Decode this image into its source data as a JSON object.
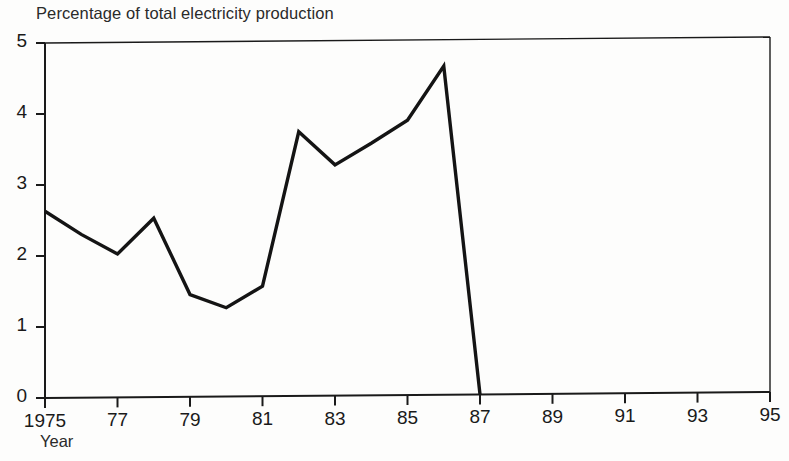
{
  "chart_data": {
    "type": "line",
    "title": "Percentage of total electricity production",
    "xlabel": "Year",
    "ylabel": "",
    "xlim": [
      1975,
      1995
    ],
    "ylim": [
      0,
      5
    ],
    "grid": false,
    "legend": null,
    "xticks": [
      1975,
      1977,
      1979,
      1981,
      1983,
      1985,
      1987,
      1989,
      1991,
      1993,
      1995
    ],
    "xtick_labels": [
      "1975",
      "77",
      "79",
      "81",
      "83",
      "85",
      "87",
      "89",
      "91",
      "93",
      "95"
    ],
    "yticks": [
      0,
      1,
      2,
      3,
      4,
      5
    ],
    "ytick_labels": [
      "0",
      "1",
      "2",
      "3",
      "4",
      "5"
    ],
    "series": [
      {
        "name": "Percentage of total electricity production",
        "color": "#141414",
        "x": [
          1975,
          1976,
          1977,
          1978,
          1979,
          1980,
          1981,
          1982,
          1983,
          1984,
          1985,
          1986,
          1987
        ],
        "values": [
          2.63,
          2.3,
          2.02,
          2.52,
          1.44,
          1.25,
          1.55,
          3.72,
          3.25,
          3.55,
          3.87,
          4.63,
          0.0
        ]
      }
    ]
  },
  "axes": {
    "frame_color": "#1a1a1a",
    "line_color": "#141414"
  }
}
